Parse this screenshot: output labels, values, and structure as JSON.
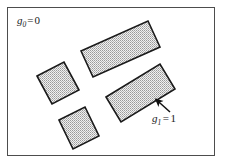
{
  "figure": {
    "background_color": "#ffffff",
    "frame": {
      "name": "image-frame",
      "x": 7.5,
      "y": 7.5,
      "width": 207,
      "height": 148,
      "stroke_color": "#4d4d4d",
      "stroke_width": 1,
      "fill_color": "#ffffff"
    },
    "region_style": {
      "stroke_color": "#1a1a1a",
      "stroke_width": 1.6,
      "fill_pattern": "stipple-dots",
      "fill_base_color": "#ededed",
      "dot_color": "#8c8c8c"
    },
    "regions": [
      {
        "name": "region-top-bar",
        "shape": "rectangle",
        "rotation_deg": -14,
        "points": "81,51 148,21 160,47 93,77"
      },
      {
        "name": "region-left-square",
        "shape": "square",
        "rotation_deg": -16,
        "points": "37,76 64,62 79,90 52,104"
      },
      {
        "name": "region-right-bar",
        "shape": "rectangle",
        "rotation_deg": 18,
        "points": "106,97 160,64 175,89 121,122"
      },
      {
        "name": "region-bottom-square",
        "shape": "square",
        "rotation_deg": -14,
        "points": "59,120 85,107 99,136 73,149"
      }
    ],
    "labels": [
      {
        "name": "background-label",
        "symbol": "g",
        "subscript": "0",
        "equals": "=",
        "value": "0",
        "full_text": "g0 = 0",
        "x": 17,
        "y": 24,
        "has_arrow": false
      },
      {
        "name": "foreground-label",
        "symbol": "g",
        "subscript": "1",
        "equals": "=",
        "value": "1",
        "full_text": "g1 = 1",
        "x": 152,
        "y": 122,
        "has_arrow": true
      }
    ],
    "arrow": {
      "name": "pointer-arrow",
      "from_x": 170,
      "from_y": 112,
      "to_x": 154,
      "to_y": 98,
      "stroke_color": "#111111",
      "stroke_width": 1.6
    }
  }
}
